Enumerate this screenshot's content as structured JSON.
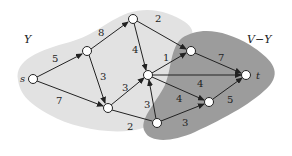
{
  "regions": {
    "Y": {
      "label": "Y",
      "color": "#e0e0e0"
    },
    "VY": {
      "label": "V−Y",
      "color": "#9a9a9a"
    }
  },
  "nodes": [
    {
      "id": "s",
      "label": "s",
      "x": 33,
      "y": 79
    },
    {
      "id": "a",
      "label": "",
      "x": 87,
      "y": 51
    },
    {
      "id": "b",
      "label": "",
      "x": 133,
      "y": 19
    },
    {
      "id": "c",
      "label": "",
      "x": 108,
      "y": 108
    },
    {
      "id": "d",
      "label": "",
      "x": 148,
      "y": 75
    },
    {
      "id": "e",
      "label": "",
      "x": 191,
      "y": 51
    },
    {
      "id": "t",
      "label": "t",
      "x": 246,
      "y": 75
    },
    {
      "id": "f",
      "label": "",
      "x": 157,
      "y": 123
    },
    {
      "id": "g",
      "label": "",
      "x": 209,
      "y": 102
    }
  ],
  "edges": [
    {
      "from": "s",
      "to": "a",
      "weight": "5"
    },
    {
      "from": "s",
      "to": "c",
      "weight": "7"
    },
    {
      "from": "a",
      "to": "b",
      "weight": "8"
    },
    {
      "from": "a",
      "to": "c",
      "weight": "3"
    },
    {
      "from": "b",
      "to": "d",
      "weight": "4"
    },
    {
      "from": "b",
      "to": "e",
      "weight": "2"
    },
    {
      "from": "c",
      "to": "d",
      "weight": "3"
    },
    {
      "from": "c",
      "to": "f",
      "weight": "2"
    },
    {
      "from": "d",
      "to": "e",
      "weight": "1"
    },
    {
      "from": "d",
      "to": "t",
      "weight": "4"
    },
    {
      "from": "d",
      "to": "g",
      "weight": "4"
    },
    {
      "from": "f",
      "to": "d",
      "weight": "3"
    },
    {
      "from": "e",
      "to": "t",
      "weight": "7"
    },
    {
      "from": "f",
      "to": "g",
      "weight": "3"
    },
    {
      "from": "g",
      "to": "t",
      "weight": "5"
    }
  ],
  "weights": {
    "sa": "5",
    "sc": "7",
    "ab": "8",
    "ac": "3",
    "bd": "4",
    "be": "2",
    "cd": "3",
    "cf": "2",
    "de": "1",
    "dt": "4",
    "dg": "4",
    "fd": "3",
    "et": "7",
    "fg": "3",
    "gt": "5"
  },
  "node_labels": {
    "s": "s",
    "t": "t"
  }
}
